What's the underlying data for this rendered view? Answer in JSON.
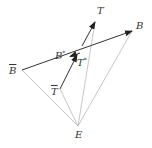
{
  "diagram": {
    "points": {
      "B_bar": {
        "label": "B",
        "accent": "bar",
        "x": 22,
        "y": 70
      },
      "B": {
        "label": "B",
        "x": 132,
        "y": 31
      },
      "T": {
        "label": "T",
        "x": 95,
        "y": 22
      },
      "B_star": {
        "label": "B",
        "sup": "*",
        "x": 72,
        "y": 56
      },
      "T_star": {
        "label": "T",
        "sup": "*",
        "x": 77,
        "y": 55
      },
      "T_bar": {
        "label": "T",
        "accent": "bar",
        "x": 60,
        "y": 89
      },
      "E": {
        "label": "E",
        "x": 78,
        "y": 126
      }
    },
    "arrows": [
      {
        "from": "B_bar",
        "to": "B",
        "color": "#333333"
      },
      {
        "from": "B",
        "to": "B_star",
        "color": "#333333"
      },
      {
        "from": "T_mid",
        "to": "T",
        "color": "#333333"
      },
      {
        "from": "T_bar",
        "to": "T_star",
        "color": "#333333"
      }
    ],
    "lines": [
      {
        "from": "E",
        "to": "B_bar",
        "color": "#b0b0b0"
      },
      {
        "from": "E",
        "to": "B",
        "color": "#b0b0b0"
      },
      {
        "from": "E",
        "to": "T",
        "color": "#b0b0b0"
      },
      {
        "from": "E",
        "to": "T_bar",
        "color": "#b0b0b0"
      }
    ]
  },
  "labels": {
    "B_bar": "B",
    "B": "B",
    "T": "T",
    "B_star": "B",
    "B_star_sup": "*",
    "T_star": "T",
    "T_star_sup": "*",
    "T_bar": "T",
    "E": "E"
  }
}
